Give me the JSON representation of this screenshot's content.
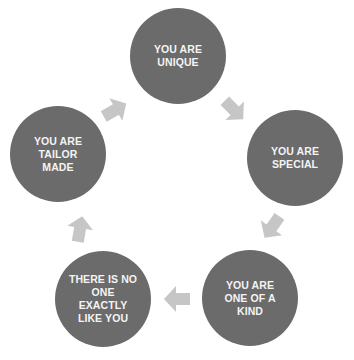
{
  "diagram": {
    "type": "cycle",
    "colors": {
      "node_fill": "#6b6b6b",
      "node_text": "#f4f4f4",
      "arrow_fill": "#c6c6c6",
      "background": "#ffffff"
    },
    "nodes": [
      {
        "id": "unique",
        "label": "YOU ARE\nUNIQUE"
      },
      {
        "id": "special",
        "label": "YOU ARE\nSPECIAL"
      },
      {
        "id": "one-of-a-kind",
        "label": "YOU ARE\nONE OF A\nKIND"
      },
      {
        "id": "no-one-like-you",
        "label": "THERE IS NO\nONE\nEXACTLY\nLIKE YOU"
      },
      {
        "id": "tailor-made",
        "label": "YOU ARE\nTAILOR\nMADE"
      }
    ],
    "arrows": [
      {
        "from": "unique",
        "to": "special",
        "direction": "down-right"
      },
      {
        "from": "special",
        "to": "one-of-a-kind",
        "direction": "down-left"
      },
      {
        "from": "one-of-a-kind",
        "to": "no-one-like-you",
        "direction": "left"
      },
      {
        "from": "no-one-like-you",
        "to": "tailor-made",
        "direction": "up"
      },
      {
        "from": "tailor-made",
        "to": "unique",
        "direction": "up-right"
      }
    ]
  }
}
